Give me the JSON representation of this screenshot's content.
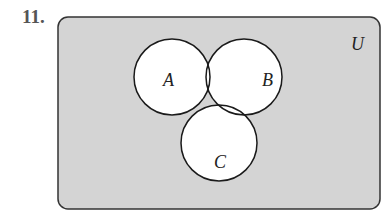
{
  "problem": {
    "number": "11."
  },
  "diagram": {
    "universe_label": "U",
    "sets": [
      {
        "label": "A"
      },
      {
        "label": "B"
      },
      {
        "label": "C"
      }
    ],
    "colors": {
      "universe_fill": "#d4d4d4",
      "set_fill": "#ffffff",
      "stroke": "#1a1a1a"
    }
  }
}
